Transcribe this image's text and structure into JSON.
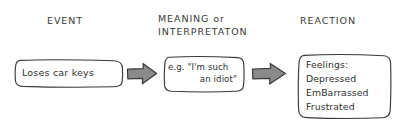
{
  "diagram": {
    "style": "hand-drawn sketch",
    "background_color": "#ffffff",
    "ink_color": "#2f2f2f",
    "arrow_fill_color": "#8a8a8a",
    "arrow_stroke_color": "#3a3a3a"
  },
  "headings": {
    "event": "EVENT",
    "meaning_line1": "MEANING or",
    "meaning_line2": "INTERPRETATON",
    "reaction": "REACTION"
  },
  "boxes": {
    "event": {
      "text": "Loses car keys"
    },
    "meaning": {
      "line1": "e.g. \"I'm such",
      "line2": "an idiot\""
    },
    "reaction": {
      "lines": [
        "Feelings:",
        "Depressed",
        "EmBarrassed",
        "Frustrated"
      ]
    }
  },
  "arrows": {
    "first": "arrow-right",
    "second": "arrow-right"
  }
}
